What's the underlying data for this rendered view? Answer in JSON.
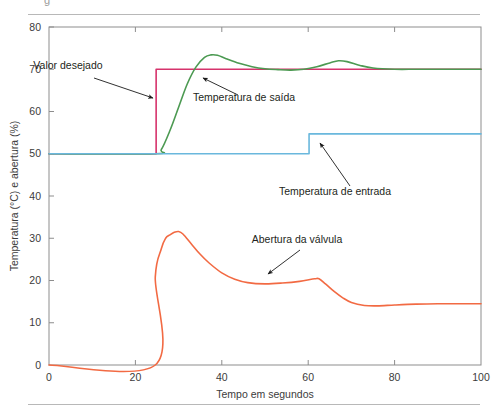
{
  "figure": {
    "background": "#ffffff",
    "has_top_rule": true,
    "has_bottom_rule": true,
    "partial_caption_glyph": "g"
  },
  "chart_data": {
    "type": "line",
    "title": "",
    "xlabel": "Tempo em segundos",
    "ylabel": "Temperatura (°C) e abertura (%)",
    "xlim": [
      0,
      100
    ],
    "ylim": [
      0,
      80
    ],
    "xticks": [
      0,
      20,
      40,
      60,
      80,
      100
    ],
    "yticks": [
      0,
      10,
      20,
      30,
      40,
      50,
      60,
      70,
      80
    ],
    "xtick_labels": [
      "0",
      "20",
      "40",
      "60",
      "80",
      "100"
    ],
    "ytick_labels": [
      "0",
      "10",
      "20",
      "30",
      "40",
      "50",
      "60",
      "70",
      "80"
    ],
    "grid": false,
    "legend": "none",
    "frame": "full-box",
    "series": [
      {
        "name": "Valor desejado",
        "color": "#d6336c",
        "style": "step",
        "x": [
          0,
          24.8,
          24.8,
          100
        ],
        "values": [
          50,
          50,
          70,
          70
        ]
      },
      {
        "name": "Temperatura de saída",
        "color": "#4c9a52",
        "style": "smooth",
        "x": [
          0,
          24.5,
          26,
          28,
          30,
          32,
          34,
          36,
          37.5,
          39,
          41,
          44,
          47,
          50,
          53,
          56,
          59,
          62,
          65,
          67,
          69,
          72,
          75,
          80,
          85,
          90,
          95,
          100
        ],
        "values": [
          50,
          50,
          51,
          55.5,
          61,
          66.5,
          70.5,
          72.8,
          73.4,
          73.3,
          72.5,
          71.4,
          70.6,
          70.1,
          69.9,
          69.8,
          70.0,
          70.6,
          71.5,
          72.0,
          71.8,
          70.9,
          70.3,
          70.0,
          70.0,
          70.0,
          70.0,
          70.0
        ]
      },
      {
        "name": "Temperatura de entrada",
        "color": "#6ab8dd",
        "style": "step",
        "x": [
          0,
          60.2,
          60.2,
          100
        ],
        "values": [
          50,
          50,
          54.7,
          54.7
        ]
      },
      {
        "name": "Abertura da válvula",
        "color": "#f26a43",
        "style": "smooth",
        "x": [
          0,
          24.6,
          24.6,
          26,
          27,
          28,
          29,
          30,
          31,
          33,
          35,
          37,
          40,
          43,
          46,
          50,
          54,
          58,
          61.5,
          62.5,
          64,
          66,
          68,
          70,
          73,
          76,
          80,
          85,
          90,
          95,
          100
        ],
        "values": [
          0,
          0,
          20.8,
          27.5,
          30.0,
          30.8,
          31.4,
          31.6,
          31.0,
          28.6,
          26.2,
          24.2,
          21.8,
          20.3,
          19.5,
          19.2,
          19.4,
          19.8,
          20.4,
          20.4,
          19.2,
          17.4,
          15.9,
          14.8,
          14.1,
          14.0,
          14.2,
          14.4,
          14.5,
          14.5,
          14.5
        ]
      }
    ],
    "annotations": [
      {
        "label": "Valor desejado",
        "text_x": 68,
        "text_y": 69,
        "arrow_from": [
          94,
          78
        ],
        "arrow_to": [
          153,
          98
        ]
      },
      {
        "label": "Temperatura de saída",
        "text_x": 244,
        "text_y": 101,
        "arrow_from": [
          238,
          95
        ],
        "arrow_to": [
          203,
          78
        ]
      },
      {
        "label": "Temperatura de entrada",
        "text_x": 335,
        "text_y": 195,
        "arrow_from": [
          350,
          186
        ],
        "arrow_to": [
          320,
          143
        ]
      },
      {
        "label": "Abertura da válvula",
        "text_x": 297,
        "text_y": 243,
        "arrow_from": [
          300,
          250
        ],
        "arrow_to": [
          268,
          274
        ]
      }
    ]
  }
}
